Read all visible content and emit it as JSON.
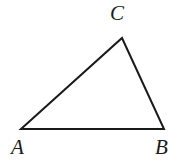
{
  "figure": {
    "kind": "geometry-diagram",
    "shape": "triangle",
    "background_color": "#ffffff",
    "stroke_color": "#1a1a1a",
    "stroke_width": 2,
    "width": 187,
    "height": 167
  },
  "triangle": {
    "vertices": [
      {
        "name": "A",
        "label": "A",
        "x": 21,
        "y": 129
      },
      {
        "name": "B",
        "label": "B",
        "x": 164,
        "y": 129
      },
      {
        "name": "C",
        "label": "C",
        "x": 122,
        "y": 38
      }
    ],
    "points_attr": "21,129 164,129 122,38",
    "edges": [
      {
        "name": "AB",
        "from": "A",
        "to": "B"
      },
      {
        "name": "BC",
        "from": "B",
        "to": "C"
      },
      {
        "name": "CA",
        "from": "C",
        "to": "A"
      }
    ]
  },
  "labels": {
    "a": "A",
    "b": "B",
    "c": "C"
  }
}
